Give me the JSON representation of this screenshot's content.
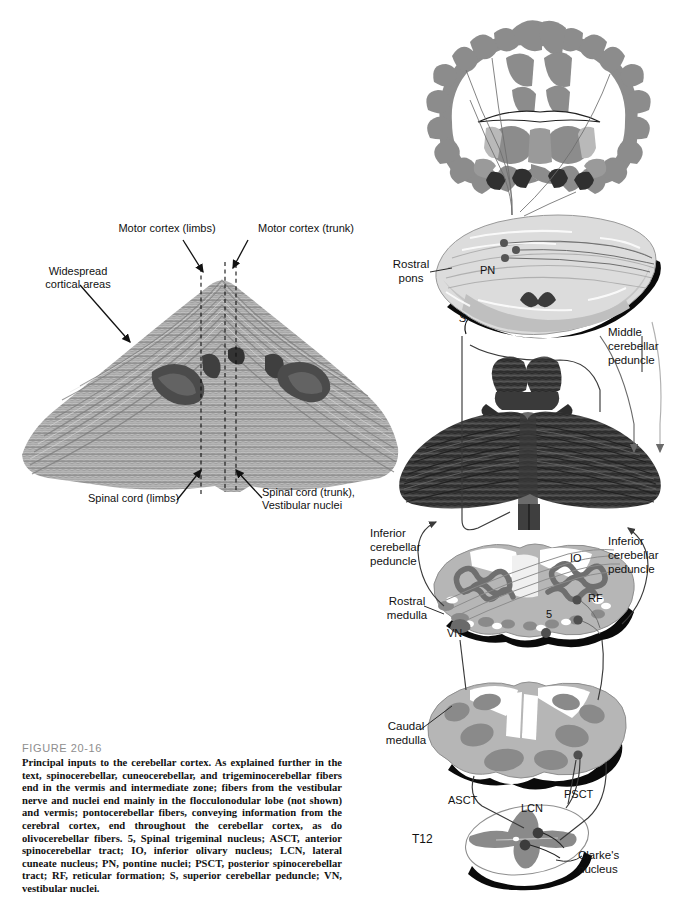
{
  "figure": {
    "number": "FIGURE 20-16",
    "caption": "Principal inputs to the cerebellar cortex. As explained further in the text, spinocerebellar, cuneocerebellar, and trigeminocerebellar fibers end in the vermis and intermediate zone; fibers from the vestibular nerve and nuclei end mainly in the flocculonodular lobe (not shown) and vermis; pontocerebellar fibers, conveying information from the cerebral cortex, end throughout the cerebellar cortex, as do olivocerebellar fibers. 5, Spinal trigeminal nucleus; ASCT, anterior spinocerebellar tract; IO, inferior olivary nucleus; LCN, lateral cuneate nucleus; PN, pontine nuclei; PSCT, posterior spinocerebellar tract; RF, reticular formation; S, superior cerebellar peduncle; VN, vestibular nuclei."
  },
  "left_panel": {
    "title": "unfolded-cerebellar-cortex-map",
    "labels": {
      "motor_cortex_limbs": "Motor cortex (limbs)",
      "motor_cortex_trunk": "Motor cortex (trunk)",
      "widespread_cortical_areas": "Widespread\ncortical areas",
      "widespread_line1": "Widespread",
      "widespread_line2": "cortical areas",
      "spinal_cord_limbs": "Spinal cord (limbs)",
      "spinal_cord_trunk_line1": "Spinal cord (trunk),",
      "spinal_cord_trunk_line2": "Vestibular nuclei"
    }
  },
  "right_panel": {
    "title": "brainstem-pathway-stack",
    "sections": [
      {
        "name": "cerebral-cortex-coronal-section",
        "label": ""
      },
      {
        "name": "rostral-pons-section",
        "label_line1": "Rostral",
        "label_line2": "pons"
      },
      {
        "name": "cerebellum-dorsal-view",
        "label": ""
      },
      {
        "name": "rostral-medulla-section",
        "label_line1": "Rostral",
        "label_line2": "medulla"
      },
      {
        "name": "caudal-medulla-section",
        "label_line1": "Caudal",
        "label_line2": "medulla"
      },
      {
        "name": "spinal-cord-t12-section",
        "label": "T12"
      }
    ],
    "peduncles": {
      "middle_line1": "Middle",
      "middle_line2": "cerebellar",
      "middle_line3": "peduncle",
      "inferior_left_line1": "Inferior",
      "inferior_left_line2": "cerebellar",
      "inferior_left_line3": "peduncle",
      "inferior_right_line1": "Inferior",
      "inferior_right_line2": "cerebellar",
      "inferior_right_line3": "peduncle"
    },
    "structure_tags": {
      "pn": "PN",
      "s_superior_peduncle": "S",
      "io": "IO",
      "rf": "RF",
      "five": "5",
      "vn": "VN",
      "asct": "ASCT",
      "lcn": "LCN",
      "psct": "PSCT",
      "clarkes_line1": "Clarke's",
      "clarkes_line2": "nucleus",
      "t12": "T12"
    }
  },
  "colors": {
    "page_background": "#ffffff",
    "ink": "#111111",
    "figure_number_gray": "#8e8e8e",
    "gray_matter": "#8c8c8c",
    "light_section": "#d8d8d8",
    "mid_section": "#b4b4b4",
    "dark_nucleus": "#6f6f6f",
    "outline_black": "#0a0a0a"
  }
}
